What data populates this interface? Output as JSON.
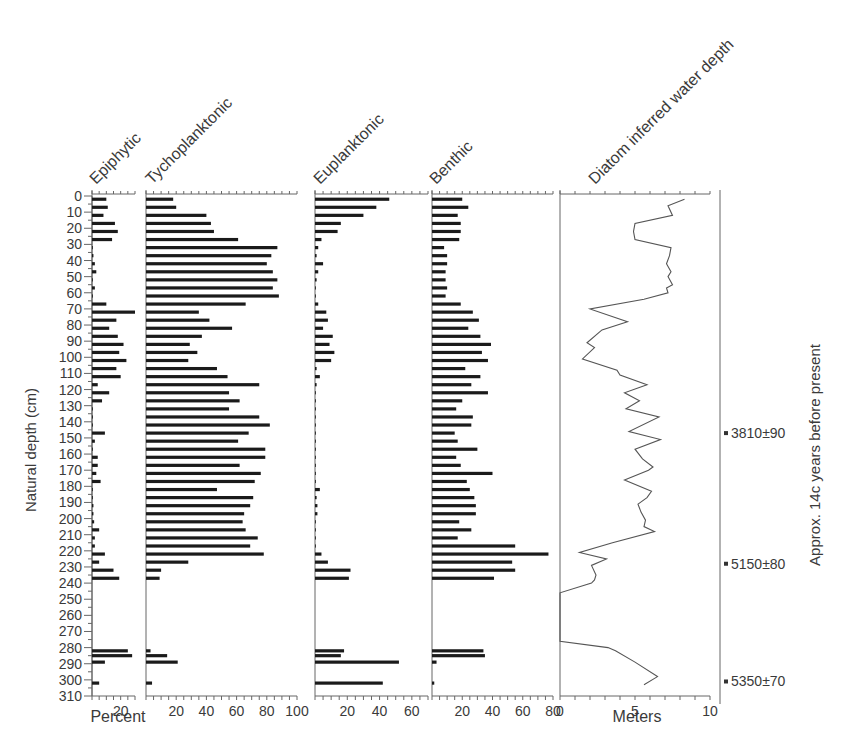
{
  "chart_data": {
    "type": "bar",
    "ylabel": "Natural depth (cm)",
    "ylim": [
      0,
      310
    ],
    "yticks": [
      0,
      10,
      20,
      30,
      40,
      50,
      60,
      70,
      80,
      90,
      100,
      110,
      120,
      130,
      140,
      150,
      160,
      170,
      180,
      190,
      200,
      210,
      220,
      230,
      240,
      250,
      260,
      270,
      280,
      290,
      300,
      310
    ],
    "xlabel_bottom_left": "Percent",
    "xlabel_bottom_right": "Meters",
    "right_axis_label": "Approx. 14c years before present",
    "dates": [
      {
        "depth": 147,
        "label": "3810±90"
      },
      {
        "depth": 228,
        "label": "5150±80"
      },
      {
        "depth": 301,
        "label": "5350±70"
      }
    ],
    "depths": [
      2,
      7,
      12,
      17,
      22,
      27,
      32,
      37,
      42,
      47,
      52,
      57,
      62,
      67,
      72,
      77,
      82,
      87,
      92,
      97,
      102,
      107,
      112,
      117,
      122,
      127,
      132,
      137,
      142,
      147,
      152,
      157,
      162,
      167,
      172,
      177,
      182,
      187,
      192,
      197,
      202,
      207,
      212,
      217,
      222,
      227,
      232,
      237,
      282,
      285,
      289,
      302
    ],
    "series": [
      {
        "name": "Epiphytic",
        "xmax": 30,
        "xticks": [
          20
        ],
        "values": [
          10,
          11,
          8,
          16,
          18,
          14,
          0,
          1,
          2,
          3,
          0.5,
          2,
          0.5,
          10,
          30,
          17,
          12,
          18,
          22,
          19,
          24,
          17,
          20,
          4,
          12,
          7,
          0.5,
          0,
          0,
          9,
          2,
          0,
          4,
          4,
          3,
          6,
          0,
          0.5,
          1,
          1,
          1.5,
          5,
          2,
          2,
          9,
          5,
          15,
          19,
          25,
          28,
          9,
          5
        ]
      },
      {
        "name": "Tychoplanktonic",
        "xmax": 100,
        "xticks": [
          20,
          40,
          60,
          80,
          100
        ],
        "values": [
          18,
          20,
          40,
          43,
          45,
          61,
          87,
          83,
          80,
          84,
          87,
          84,
          88,
          66,
          35,
          42,
          57,
          37,
          29,
          34,
          28,
          47,
          54,
          75,
          55,
          62,
          55,
          75,
          82,
          68,
          61,
          79,
          79,
          62,
          76,
          72,
          47,
          71,
          69,
          65,
          64,
          66,
          74,
          69,
          78,
          28,
          10,
          9,
          3,
          14,
          21,
          4,
          48,
          69,
          82
        ]
      },
      {
        "name": "Euplanktonic",
        "xmax": 70,
        "xticks": [
          20,
          40,
          60
        ],
        "values": [
          46,
          38,
          30,
          16,
          14,
          4,
          2,
          1,
          5,
          2,
          1,
          0.5,
          0,
          2,
          7,
          8,
          5,
          11,
          9,
          12,
          10,
          1,
          3,
          1,
          0,
          0,
          0.5,
          0,
          0,
          0.5,
          0,
          0,
          0,
          0,
          0,
          0,
          3,
          1,
          1.5,
          1.5,
          0.5,
          0,
          0,
          0,
          4,
          8,
          22,
          21,
          18,
          16,
          52,
          42,
          28,
          64
        ]
      },
      {
        "name": "Benthic",
        "xmax": 80,
        "xticks": [
          20,
          40,
          60,
          80
        ],
        "values": [
          20,
          24,
          17,
          19,
          19,
          18,
          8,
          10,
          10,
          9,
          9,
          10,
          9,
          19,
          27,
          31,
          24,
          32,
          39,
          33,
          37,
          22,
          32,
          26,
          37,
          20,
          16,
          27,
          26,
          15,
          17,
          30,
          16,
          19,
          40,
          23,
          25,
          28,
          29,
          29,
          18,
          26,
          17,
          55,
          77,
          53,
          55,
          41,
          34,
          35,
          3,
          1.5,
          23
        ]
      },
      {
        "name": "Diatom inferred water depth",
        "type": "line",
        "xmax": 10,
        "xticks": [
          5,
          10
        ],
        "unit": "Meters",
        "points": [
          [
            8.3,
            2
          ],
          [
            7.2,
            6
          ],
          [
            7.5,
            12
          ],
          [
            5.0,
            17
          ],
          [
            4.9,
            22
          ],
          [
            5.0,
            27
          ],
          [
            7.4,
            32
          ],
          [
            7.3,
            37
          ],
          [
            7.1,
            42
          ],
          [
            7.4,
            47
          ],
          [
            7.2,
            50
          ],
          [
            7.5,
            55
          ],
          [
            7.1,
            57
          ],
          [
            7.2,
            60
          ],
          [
            5.6,
            64
          ],
          [
            2.0,
            70
          ],
          [
            4.5,
            78
          ],
          [
            2.8,
            83
          ],
          [
            1.8,
            91
          ],
          [
            2.3,
            94
          ],
          [
            1.5,
            101
          ],
          [
            3.8,
            108
          ],
          [
            4.0,
            111
          ],
          [
            5.8,
            117
          ],
          [
            4.3,
            122
          ],
          [
            5.3,
            127
          ],
          [
            4.4,
            132
          ],
          [
            6.6,
            137
          ],
          [
            4.6,
            146
          ],
          [
            6.7,
            151
          ],
          [
            5.0,
            157
          ],
          [
            5.5,
            163
          ],
          [
            6.2,
            168
          ],
          [
            5.9,
            170
          ],
          [
            4.3,
            176
          ],
          [
            6.1,
            183
          ],
          [
            5.8,
            187
          ],
          [
            5.2,
            191
          ],
          [
            5.4,
            196
          ],
          [
            5.7,
            201
          ],
          [
            5.6,
            205
          ],
          [
            6.3,
            208
          ],
          [
            3.5,
            215
          ],
          [
            1.3,
            221
          ],
          [
            3.1,
            225
          ],
          [
            2.1,
            229
          ],
          [
            2.4,
            235
          ],
          [
            2.3,
            238
          ],
          [
            2.1,
            240
          ],
          [
            0,
            246
          ],
          [
            0,
            276
          ],
          [
            3.2,
            280
          ],
          [
            3.7,
            282
          ],
          [
            5.0,
            289
          ],
          [
            6.5,
            298
          ],
          [
            5.6,
            303
          ]
        ]
      }
    ]
  },
  "labels": {
    "epiphytic": "Epiphytic",
    "tychoplanktonic": "Tychoplanktonic",
    "euplanktonic": "Euplanktonic",
    "benthic": "Benthic",
    "water_depth": "Diatom inferred water depth",
    "y_axis": "Natural depth (cm)",
    "percent": "Percent",
    "meters": "Meters",
    "right_axis": "Approx. 14c years before present"
  },
  "colors": {
    "bar": "#1a1a1a",
    "axis": "#666666",
    "line": "#555555",
    "text": "#3a3a3a"
  }
}
